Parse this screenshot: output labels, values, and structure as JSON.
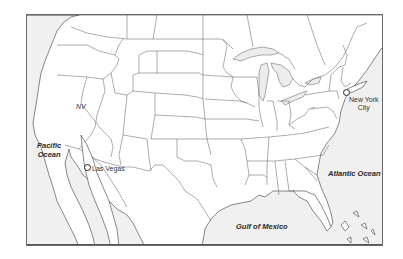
{
  "map": {
    "title": "",
    "region": "Contiguous United States",
    "colors": {
      "land": "#ffffff",
      "water": "#f0f0f0",
      "borders": "#555555",
      "frame": "#6a6a6a"
    },
    "water_labels": [
      {
        "id": "pacific",
        "lines": [
          "Pacific",
          "Ocean"
        ]
      },
      {
        "id": "atlantic",
        "text": "Atlantic Ocean"
      },
      {
        "id": "gulf",
        "text": "Gulf of Mexico"
      }
    ],
    "state_labels": [
      {
        "id": "nevada",
        "text": "NV"
      }
    ],
    "cities": [
      {
        "id": "las-vegas",
        "text": "Las Vegas",
        "marker": "circle-marker"
      },
      {
        "id": "new-york-city",
        "lines": [
          "New York",
          "City"
        ],
        "marker": "circle-marker"
      }
    ]
  }
}
